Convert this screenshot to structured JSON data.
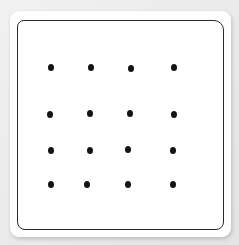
{
  "card": {
    "background": "#ffffff",
    "border_color": "#2a2a2a"
  },
  "dot_grid": {
    "rows": 4,
    "cols": 4,
    "dot_color": "#141414",
    "dots": [
      {
        "row": 1,
        "col": 1,
        "x": 51,
        "y": 67
      },
      {
        "row": 1,
        "col": 2,
        "x": 91,
        "y": 67
      },
      {
        "row": 1,
        "col": 3,
        "x": 131,
        "y": 68
      },
      {
        "row": 1,
        "col": 4,
        "x": 174,
        "y": 67
      },
      {
        "row": 2,
        "col": 1,
        "x": 50,
        "y": 114
      },
      {
        "row": 2,
        "col": 2,
        "x": 90,
        "y": 113
      },
      {
        "row": 2,
        "col": 3,
        "x": 130,
        "y": 113
      },
      {
        "row": 2,
        "col": 4,
        "x": 174,
        "y": 114
      },
      {
        "row": 3,
        "col": 1,
        "x": 51,
        "y": 150
      },
      {
        "row": 3,
        "col": 2,
        "x": 90,
        "y": 150
      },
      {
        "row": 3,
        "col": 3,
        "x": 128,
        "y": 149
      },
      {
        "row": 3,
        "col": 4,
        "x": 173,
        "y": 150
      },
      {
        "row": 4,
        "col": 1,
        "x": 51,
        "y": 184
      },
      {
        "row": 4,
        "col": 2,
        "x": 87,
        "y": 184
      },
      {
        "row": 4,
        "col": 3,
        "x": 128,
        "y": 184
      },
      {
        "row": 4,
        "col": 4,
        "x": 173,
        "y": 184
      }
    ]
  }
}
